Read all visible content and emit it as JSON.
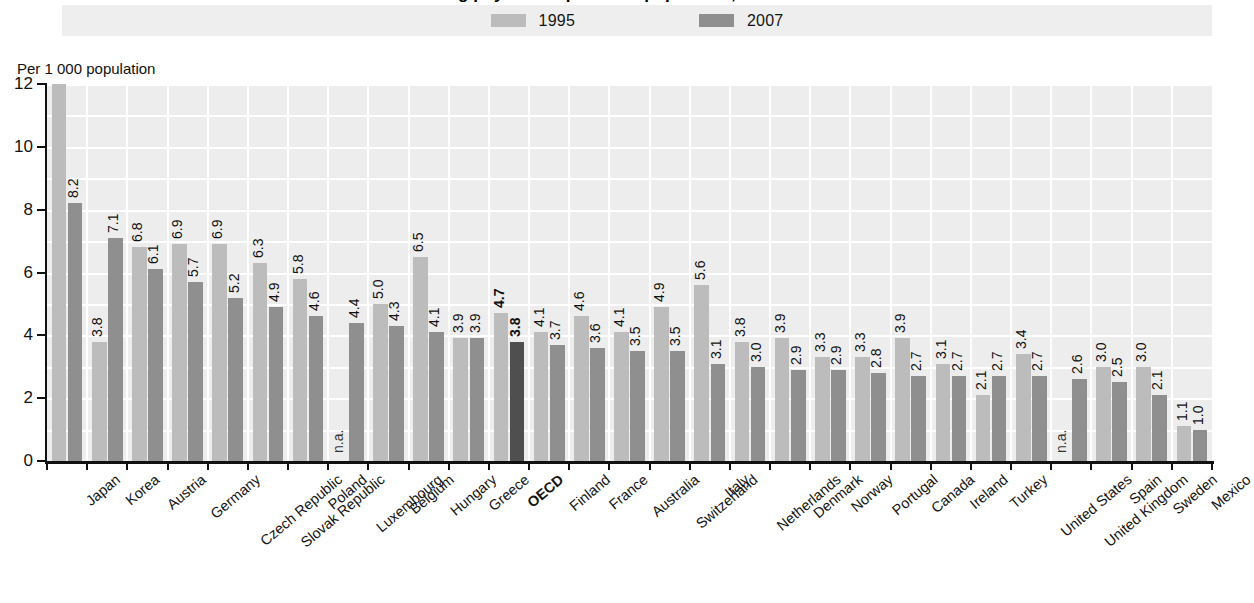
{
  "title": "Practising physicians per 1 000 population, 1995 and 2007",
  "axis_unit": "Per 1 000 population",
  "legend": {
    "entries": [
      {
        "label": "1995",
        "color": "#bcbcbc",
        "swatch_name": "legend-swatch-1995"
      },
      {
        "label": "2007",
        "color": "#8f8f8f",
        "swatch_name": "legend-swatch-2007"
      }
    ]
  },
  "colors": {
    "series_1995": "#bcbcbc",
    "series_2007": "#8f8f8f",
    "highlight_2007": "#4f4f4f",
    "plot_background": "#ededed",
    "gridline": "#ffffff",
    "axis": "#111111"
  },
  "chart_data": {
    "type": "bar",
    "title": "Practising physicians per 1 000 population, 1995 and 2007",
    "xlabel": "",
    "ylabel": "Per 1 000 population",
    "ylim": [
      0,
      12
    ],
    "yticks": [
      0,
      2,
      4,
      6,
      8,
      10,
      12
    ],
    "ytick_labels": [
      "0",
      "2",
      "4",
      "6",
      "8",
      "10",
      "12"
    ],
    "grid": true,
    "legend_position": "top-center",
    "na_label": "n.a.",
    "highlight_category": "OECD",
    "categories": [
      "Japan",
      "Korea",
      "Austria",
      "Germany",
      "Czech Republic",
      "Slovak Republic",
      "Poland",
      "Luxembourg",
      "Belgium",
      "Hungary",
      "Greece",
      "OECD",
      "Finland",
      "France",
      "Australia",
      "Switzerland",
      "Italy",
      "Netherlands",
      "Denmark",
      "Norway",
      "Portugal",
      "Canada",
      "Ireland",
      "Turkey",
      "United States",
      "United Kingdom",
      "Spain",
      "Sweden",
      "Mexico"
    ],
    "series": [
      {
        "name": "1995",
        "values": [
          12.0,
          3.8,
          6.8,
          6.9,
          6.9,
          6.3,
          5.8,
          null,
          5.0,
          6.5,
          3.9,
          4.7,
          4.1,
          4.6,
          4.1,
          4.9,
          5.6,
          3.8,
          3.9,
          3.3,
          3.3,
          3.9,
          3.1,
          2.1,
          3.4,
          null,
          3.0,
          3.0,
          1.1
        ],
        "labels": [
          "12.0",
          "3.8",
          "6.8",
          "6.9",
          "6.9",
          "6.3",
          "5.8",
          "n.a.",
          "5.0",
          "6.5",
          "3.9",
          "4.7",
          "4.1",
          "4.6",
          "4.1",
          "4.9",
          "5.6",
          "3.8",
          "3.9",
          "3.3",
          "3.3",
          "3.9",
          "3.1",
          "2.1",
          "3.4",
          "n.a.",
          "3.0",
          "3.0",
          "1.1"
        ]
      },
      {
        "name": "2007",
        "values": [
          8.2,
          7.1,
          6.1,
          5.7,
          5.2,
          4.9,
          4.6,
          4.4,
          4.3,
          4.1,
          3.9,
          3.8,
          3.7,
          3.6,
          3.5,
          3.5,
          3.1,
          3.0,
          2.9,
          2.9,
          2.8,
          2.7,
          2.7,
          2.7,
          2.7,
          2.6,
          2.5,
          2.1,
          1.0
        ],
        "labels": [
          "8.2",
          "7.1",
          "6.1",
          "5.7",
          "5.2",
          "4.9",
          "4.6",
          "4.4",
          "4.3",
          "4.1",
          "3.9",
          "3.8",
          "3.7",
          "3.6",
          "3.5",
          "3.5",
          "3.1",
          "3.0",
          "2.9",
          "2.9",
          "2.8",
          "2.7",
          "2.7",
          "2.7",
          "2.7",
          "2.6",
          "2.5",
          "2.1",
          "1.0"
        ]
      }
    ]
  }
}
